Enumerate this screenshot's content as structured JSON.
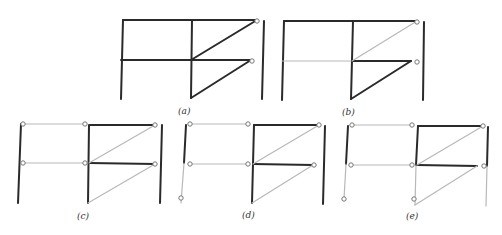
{
  "figure": {
    "panels": [
      {
        "id": "a",
        "label": "(a)"
      },
      {
        "id": "b",
        "label": "(b)"
      },
      {
        "id": "c",
        "label": "(c)"
      },
      {
        "id": "d",
        "label": "(d)"
      },
      {
        "id": "e",
        "label": "(e)"
      }
    ],
    "colors": {
      "thick_member": "#2a2a2a",
      "thin_member": "#b8b8b8",
      "hinge": "#777777"
    }
  }
}
